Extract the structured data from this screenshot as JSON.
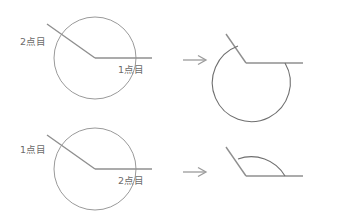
{
  "page": {
    "background_color": "#ffffff",
    "line_color": "#8f8f8f",
    "label_color": "#6b6b6b",
    "width": 349,
    "height": 222
  },
  "rows": [
    {
      "id": "row-top",
      "result_type": "reflex-angle-arc",
      "source": {
        "label_first": "1点目",
        "label_second": "2点目",
        "first_point_position": "right-horizontal-ray",
        "second_point_position": "upper-left-ray"
      },
      "arrow": "→",
      "arrow_name": "right-arrow"
    },
    {
      "id": "row-bottom",
      "result_type": "minor-angle-arc",
      "source": {
        "label_first": "1点目",
        "label_second": "2点目",
        "first_point_position": "upper-left-ray",
        "second_point_position": "right-horizontal-ray"
      },
      "arrow": "→",
      "arrow_name": "right-arrow"
    }
  ],
  "labels": {
    "top_left_upper": "2点目",
    "top_left_lower": "1点目",
    "bottom_left_upper": "1点目",
    "bottom_left_lower": "2点目"
  }
}
